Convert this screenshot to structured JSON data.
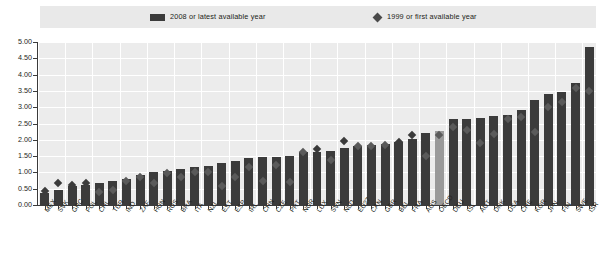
{
  "legend": {
    "items": [
      {
        "label": "2008 or latest available year",
        "marker": "square-swatch",
        "color": "#3b3b3b"
      },
      {
        "label": "1999 or first available year",
        "marker": "diamond-marker",
        "color": "#4a4a4a"
      }
    ]
  },
  "axis": {
    "y_ticks": [
      "5.00",
      "4.50",
      "4.00",
      "3.50",
      "3.00",
      "2.50",
      "2.00",
      "1.50",
      "1.00",
      "0.50",
      "0.00"
    ]
  },
  "colors": {
    "bar": "#3b3b3b",
    "bar_highlight": "#9a9a9a",
    "marker": "#5a5a5a",
    "plot_background": "#ececec",
    "legend_background": "#e9e9e9",
    "gridline": "#ffffff",
    "axis": "#3a3a3a",
    "text": "#231f20"
  },
  "chart_data": {
    "type": "bar",
    "title": "",
    "subtitle": "",
    "xlabel": "",
    "ylabel": "",
    "ylim": [
      0,
      5.0
    ],
    "ytick_step": 0.5,
    "grid": true,
    "legend_position": "top",
    "categories": [
      "MEX",
      "SVK",
      "GRC",
      "POL",
      "CHL",
      "TUR",
      "IND",
      "ZAF",
      "HUN",
      "RUS",
      "BRA",
      "ITA",
      "NZL",
      "EST",
      "ESP",
      "IRL",
      "CHN",
      "CZE",
      "PRT",
      "NOR",
      "LUX",
      "SVN",
      "NLD",
      "EU27",
      "CAN",
      "GBR",
      "BEL",
      "FRA",
      "AUS",
      "OECD",
      "DEU",
      "ISL",
      "AUT",
      "DNK",
      "USA",
      "CHE",
      "KOR",
      "JPN",
      "FIN",
      "SWE",
      "ISR"
    ],
    "highlight_category": "OECD",
    "series": [
      {
        "name": "2008 or latest available year",
        "type": "bar",
        "values": [
          0.37,
          0.47,
          0.58,
          0.61,
          0.68,
          0.73,
          0.8,
          0.93,
          1.0,
          1.03,
          1.09,
          1.18,
          1.21,
          1.29,
          1.35,
          1.43,
          1.47,
          1.47,
          1.51,
          1.62,
          1.62,
          1.66,
          1.75,
          1.81,
          1.84,
          1.88,
          1.92,
          2.02,
          2.21,
          2.28,
          2.63,
          2.65,
          2.67,
          2.72,
          2.77,
          2.9,
          3.21,
          3.42,
          3.46,
          3.75,
          4.86
        ]
      },
      {
        "name": "1999 or first available year",
        "type": "scatter",
        "values": [
          0.43,
          0.66,
          0.6,
          0.69,
          0.41,
          0.47,
          0.75,
          0.85,
          0.67,
          0.99,
          0.87,
          1.02,
          1.01,
          0.57,
          0.86,
          1.17,
          0.75,
          1.23,
          0.72,
          1.62,
          1.71,
          1.37,
          1.96,
          1.8,
          1.81,
          1.83,
          1.94,
          2.16,
          1.51,
          2.16,
          2.4,
          2.3,
          1.89,
          2.18,
          2.64,
          2.69,
          2.25,
          3.02,
          3.17,
          3.58,
          3.51
        ]
      }
    ]
  }
}
